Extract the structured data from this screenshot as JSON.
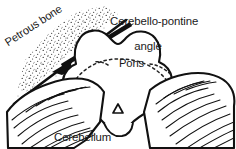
{
  "figure": {
    "title_text": "",
    "background_color": "#ffffff",
    "ink_color": "#1a1a1a",
    "width": 236,
    "height": 149
  },
  "labels": {
    "cerebello_pontine_angle": {
      "line1": "Cerebello-pontine",
      "line2": "angle"
    },
    "petrous_bone": "Petrous bone",
    "pons": "Pons",
    "cerebellum": "Cerebellum",
    "marker_symbol": "Δ"
  },
  "structures": [
    {
      "name": "petrous-bone",
      "style": "stippled-band",
      "label": "Petrous bone",
      "orientation": "diagonal-upper-left"
    },
    {
      "name": "pons",
      "style": "outlined-lobed-body",
      "label": "Pons",
      "orientation": "center"
    },
    {
      "name": "cerebellum",
      "style": "hatched-lobes",
      "label": "Cerebellum",
      "orientation": "lower-left-and-lower-right"
    }
  ],
  "annotations": {
    "pointer_arrow": {
      "name": "cerebello-pontine-angle-arrow",
      "direction": "down-left",
      "from": [
        128,
        26
      ],
      "to": [
        55,
        70
      ]
    },
    "pons_leader_left": {
      "name": "pons-dashed-leader-left",
      "style": "dashed"
    },
    "pons_leader_right": {
      "name": "pons-dashed-leader-right",
      "style": "dashed"
    }
  },
  "colors": {
    "ink": "#1a1a1a",
    "paper": "#ffffff",
    "stipple": "#3a3a3a"
  }
}
